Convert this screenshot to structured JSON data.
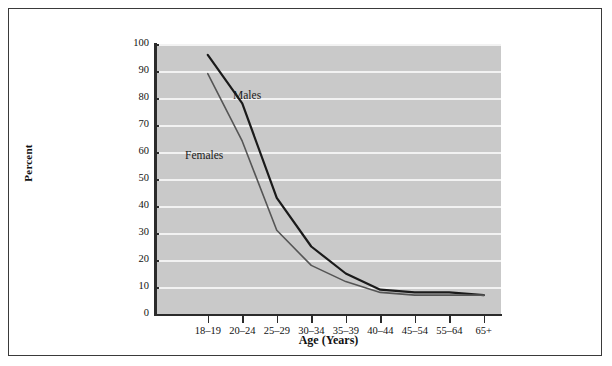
{
  "chart_data": {
    "type": "line",
    "title": "",
    "xlabel": "Age (Years)",
    "ylabel": "Percent",
    "categories": [
      "18–19",
      "20–24",
      "25–29",
      "30–34",
      "35–39",
      "40–44",
      "45–54",
      "55–64",
      "65+"
    ],
    "ylim": [
      0,
      100
    ],
    "yticks": [
      0,
      10,
      20,
      30,
      40,
      50,
      60,
      70,
      80,
      90,
      100
    ],
    "ytick_labels": [
      "0",
      "10",
      "20",
      "30",
      "40",
      "50",
      "60",
      "70",
      "80",
      "90",
      "100"
    ],
    "grid": "horizontal",
    "legend": "inline-annotations",
    "series": [
      {
        "name": "Males",
        "color": "#1a1a1a",
        "values": [
          96,
          78,
          43,
          25,
          15,
          9,
          8,
          8,
          7
        ]
      },
      {
        "name": "Females",
        "color": "#555555",
        "values": [
          89,
          64,
          31,
          18,
          12,
          8,
          7,
          7,
          7
        ]
      }
    ],
    "annotations": [
      {
        "text": "Males",
        "series": "Males"
      },
      {
        "text": "Females",
        "series": "Females"
      }
    ]
  },
  "axes": {
    "y_title": "Percent",
    "x_title": "Age (Years)"
  },
  "colors": {
    "plot_background": "#c9c9c9",
    "gridline": "#f2f2f2",
    "axis": "#2b2b2b",
    "frame_border": "#3a3a3a",
    "page_background": "#ffffff"
  }
}
